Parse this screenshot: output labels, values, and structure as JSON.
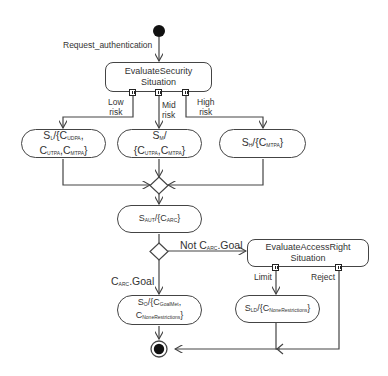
{
  "diagram": {
    "type": "UML activity diagram",
    "start_label": "Request_authentication",
    "actions": {
      "evaluate_security": {
        "line1": "EvaluateSecurity",
        "line2": "Situation"
      },
      "evaluate_access": {
        "line1": "EvaluateAccessRight",
        "line2": "Situation"
      }
    },
    "risk_labels": {
      "low": {
        "l1": "Low",
        "l2": "risk"
      },
      "mid": {
        "l1": "Mid",
        "l2": "risk"
      },
      "high": {
        "l1": "High",
        "l2": "risk"
      }
    },
    "states": {
      "low": {
        "s": "S",
        "s_sub": "L",
        "pre": "/{C",
        "c1_sub": "UDPA",
        "sep1": ",",
        "c2": "C",
        "c2_sub": "UTPA",
        "sep2": ",C",
        "c3_sub": "MTPA",
        "post": "}"
      },
      "mid": {
        "s": "S",
        "s_sub": "M",
        "pre": "/",
        "c1": "{C",
        "c1_sub": "UTPA",
        "sep": ",C",
        "c2_sub": "MTPA",
        "post": "}"
      },
      "high": {
        "s": "S",
        "s_sub": "H",
        "pre": "/{C",
        "c1_sub": "MTPA",
        "post": "}"
      },
      "auth": {
        "s": "S",
        "s_sub": "AUT",
        "pre": "/{C",
        "c1_sub": "ARC",
        "post": "}"
      },
      "goal": {
        "s": "S",
        "s_sub": "O",
        "pre": "/{C",
        "c1_sub": "GoalMet",
        "sep": ",",
        "c2": "C",
        "c2_sub": "NoneRestrictions",
        "post": "}"
      },
      "limit": {
        "s": "S",
        "s_sub": "LD",
        "pre": "/{C",
        "c1_sub": "NoneRestrictions",
        "post": "}"
      }
    },
    "guards": {
      "not_goal": {
        "pre": "Not C",
        "sub": "ARC",
        "post": ".Goal"
      },
      "goal": {
        "pre": "C",
        "sub": "ARC",
        "post": ".Goal"
      },
      "limit": "Limit",
      "reject": "Reject"
    },
    "colors": {
      "line": "#444444",
      "node_fill": "#ffffff",
      "text": "#333333",
      "initial": "#111111"
    }
  }
}
